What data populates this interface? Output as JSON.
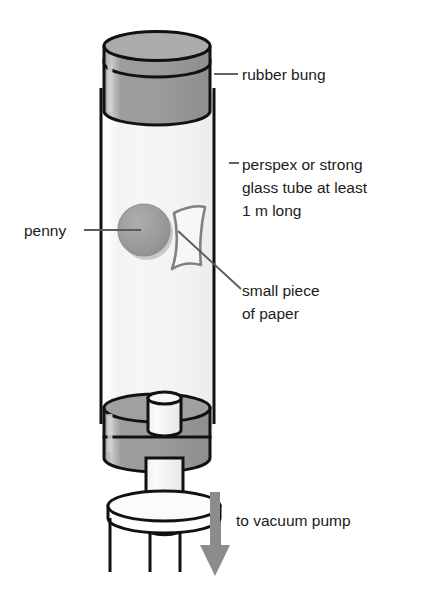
{
  "figure": {
    "background_color": "#ffffff"
  },
  "colors": {
    "outline": "#111111",
    "bung_fill": "#9e9e9e",
    "bung_top_fill": "#a8a8a8",
    "bung_side_shade": "#8e8e8e",
    "tube_fill": "#f4f4f4",
    "tube_highlight": "#ffffff",
    "penny_fill": "#9a9a9a",
    "penny_shadow": "#b5b5b5",
    "paper_stroke": "#808080",
    "arrow_fill": "#8c8c8c",
    "leader_line": "#5b5b5b",
    "text": "#1b1b1b",
    "stand_fill": "#ffffff"
  },
  "labels": [
    {
      "id": "rubber-bung",
      "name": "rubber bung",
      "lines": [
        "rubber bung"
      ],
      "text_x": 242,
      "text_y": 80,
      "leader": "M 214 74 L 238 74"
    },
    {
      "id": "tube",
      "name": "perspex or strong glass tube",
      "lines": [
        "perspex or strong",
        "glass tube at least",
        "1 m long"
      ],
      "text_x": 242,
      "text_y": 170,
      "leader": "M 229 163 L 238 163"
    },
    {
      "id": "penny",
      "name": "penny",
      "lines": [
        "penny"
      ],
      "text_x": 24,
      "text_y": 236,
      "leader": "M 84 230 L 141 230"
    },
    {
      "id": "small-piece-of-paper",
      "name": "small piece of paper",
      "lines": [
        "small piece",
        "of paper"
      ],
      "text_x": 242,
      "text_y": 296,
      "leader": "M 176 228 L 239 288"
    },
    {
      "id": "to-vacuum-pump",
      "name": "to vacuum pump",
      "lines": [
        "to vacuum pump"
      ],
      "text_x": 236,
      "text_y": 526,
      "leader": ""
    }
  ],
  "components": [
    {
      "id": "rubber-bung-top",
      "name": "rubber bung (top)"
    },
    {
      "id": "glass-tube",
      "name": "perspex / glass tube"
    },
    {
      "id": "penny-disc",
      "name": "penny"
    },
    {
      "id": "paper-piece",
      "name": "small piece of paper"
    },
    {
      "id": "rubber-bung-bottom",
      "name": "rubber bung (bottom)"
    },
    {
      "id": "outlet-nozzle",
      "name": "outlet nozzle"
    },
    {
      "id": "stand-base",
      "name": "tripod stand"
    },
    {
      "id": "vacuum-arrow",
      "name": "vacuum flow arrow"
    }
  ],
  "geometry": {
    "tube_left": 101,
    "tube_right": 214,
    "tube_top": 78,
    "tube_bottom": 424,
    "arrow_x": 215,
    "arrow_top": 492,
    "arrow_bottom": 576
  }
}
